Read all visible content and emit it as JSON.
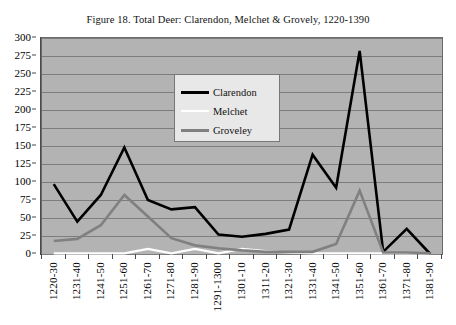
{
  "figure": {
    "title": "Figure 18. Total Deer: Clarendon, Melchet & Grovely, 1220-1390",
    "plot_bg_color": "#b3b3b3",
    "grid_color": "#7d7d7d",
    "border_color": "#6b6b6b"
  },
  "legend": {
    "position": "inside-top-center",
    "entries": [
      {
        "label": "Clarendon",
        "color": "#000000",
        "width": 3
      },
      {
        "label": "Melchet",
        "color": "#ffffff",
        "width": 2
      },
      {
        "label": "Groveley",
        "color": "#808080",
        "width": 3
      }
    ]
  },
  "chart_data": {
    "type": "line",
    "title": "Figure 18. Total Deer: Clarendon, Melchet & Grovely, 1220-1390",
    "xlabel": "",
    "ylabel": "",
    "ylim": [
      0,
      300
    ],
    "ytick_step": 25,
    "grid": true,
    "legend_position": "inside-top-center",
    "ytick_labels": [
      "300",
      "275",
      "250",
      "225",
      "200",
      "175",
      "150",
      "125",
      "100",
      "75",
      "50",
      "25",
      "0"
    ],
    "categories": [
      "1220-30",
      "1231-40",
      "1241-50",
      "1251-60",
      "1261-70",
      "1271-80",
      "1281-90",
      "1291-1300",
      "1301-10",
      "1311-20",
      "1321-30",
      "1331-40",
      "1341-50",
      "1351-60",
      "1361-70",
      "1371-80",
      "1381-90"
    ],
    "series": [
      {
        "name": "Clarendon",
        "color": "#000000",
        "values": [
          97,
          45,
          82,
          148,
          75,
          62,
          65,
          27,
          24,
          28,
          34,
          138,
          92,
          282,
          3,
          35,
          0
        ]
      },
      {
        "name": "Melchet",
        "color": "#ffffff",
        "values": [
          1,
          1,
          1,
          1,
          7,
          1,
          7,
          1,
          7,
          4,
          2,
          1,
          1,
          1,
          1,
          1,
          1
        ]
      },
      {
        "name": "Groveley",
        "color": "#808080",
        "values": [
          18,
          21,
          40,
          82,
          52,
          22,
          12,
          8,
          5,
          3,
          3,
          3,
          14,
          88,
          2,
          2,
          1
        ]
      }
    ]
  }
}
